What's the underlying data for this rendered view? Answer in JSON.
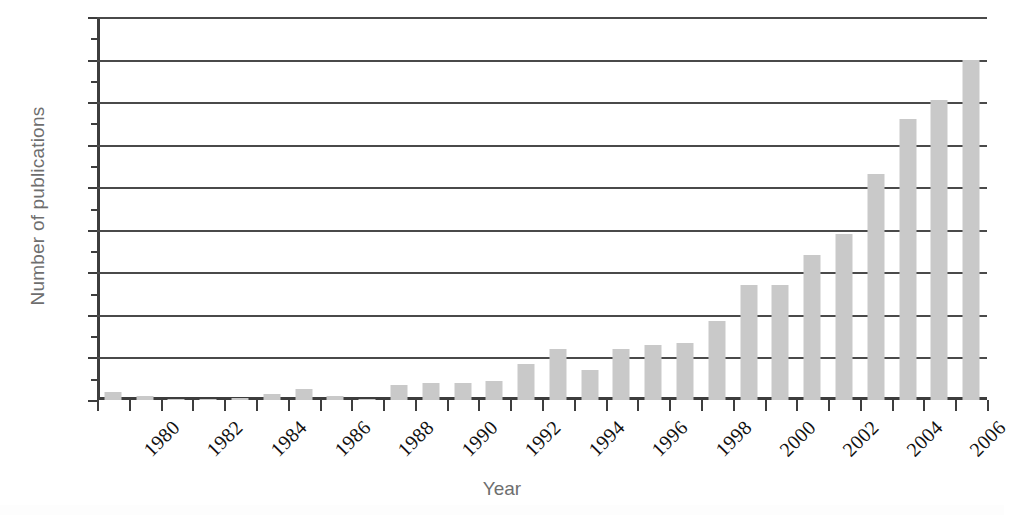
{
  "chart_data": {
    "type": "bar",
    "title": "",
    "xlabel": "Year",
    "ylabel": "Number of publications",
    "categories": [
      "1980",
      "1981",
      "1982",
      "1983",
      "1984",
      "1985",
      "1986",
      "1987",
      "1988",
      "1989",
      "1990",
      "1991",
      "1992",
      "1993",
      "1994",
      "1995",
      "1996",
      "1997",
      "1998",
      "1999",
      "2000",
      "2001",
      "2002",
      "2003",
      "2004",
      "2005",
      "2006",
      "2007"
    ],
    "values": [
      4,
      2,
      0.5,
      0.5,
      1,
      3,
      5,
      2,
      0.5,
      7,
      8,
      8,
      9,
      17,
      24,
      14,
      24,
      26,
      27,
      37,
      54,
      54,
      68,
      78,
      106,
      132,
      141,
      160
    ],
    "x_tick_labels": [
      "1980",
      "1982",
      "1984",
      "1986",
      "1988",
      "1990",
      "1992",
      "1994",
      "1996",
      "1998",
      "2000",
      "2002",
      "2004",
      "2006"
    ],
    "y_tick_labels": [
      "0",
      "20",
      "40",
      "60",
      "80",
      "100",
      "120",
      "140",
      "160",
      "180"
    ],
    "y_tick_values": [
      0,
      20,
      40,
      60,
      80,
      100,
      120,
      140,
      160,
      180
    ],
    "ylim": [
      0,
      180
    ],
    "grid": true,
    "legend": false,
    "bar_color": "#c9c9c9",
    "axis_color": "#3d3d3d",
    "grid_color": "#4a4a4a",
    "label_color": "#6e6e6e",
    "tick_color": "#111111"
  }
}
